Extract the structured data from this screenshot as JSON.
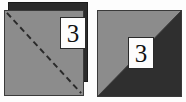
{
  "figure": {
    "background_color": "#fdfdfd",
    "panels": [
      {
        "id": "left",
        "name": "folded-sheet-with-fold-line",
        "description": "Gray square sheet with a darker square behind it, crossed by a dashed diagonal fold line",
        "front_face_color": "#8c8c8c",
        "back_face_color": "#2b2b2b",
        "outline_color": "#3a3a3a",
        "fold_line": {
          "style": "dashed",
          "color": "#2a2a2a",
          "direction": "top-left-to-bottom-right"
        },
        "label": {
          "text": "3",
          "box_fill": "#fdfdfd",
          "box_border": "#2a2a2a",
          "text_color": "#111111"
        }
      },
      {
        "id": "right",
        "name": "folded-sheet-result",
        "description": "Square split along a diagonal into a light gray upper-left triangle and a dark lower-right triangle",
        "light_triangle_color": "#8c8c8c",
        "dark_triangle_color": "#2f2f2f",
        "outline_color": "#3a3a3a",
        "diagonal": {
          "direction": "top-right-to-bottom-left"
        },
        "label": {
          "text": "3",
          "box_fill": "#fdfdfd",
          "box_border": "#2a2a2a",
          "text_color": "#111111"
        }
      }
    ]
  }
}
